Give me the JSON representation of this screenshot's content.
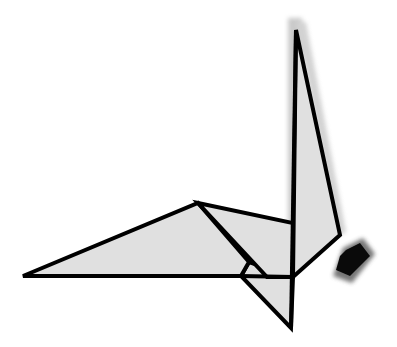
{
  "figure": {
    "subject": "Origami crane diagram",
    "colors": {
      "background": "#ffffff",
      "paper_fill": "#e0e0e0",
      "outline": "#000000",
      "shadow": "#b5b5b5",
      "head_dark": "#0a0a0a",
      "head_shadow": "#555555"
    }
  }
}
